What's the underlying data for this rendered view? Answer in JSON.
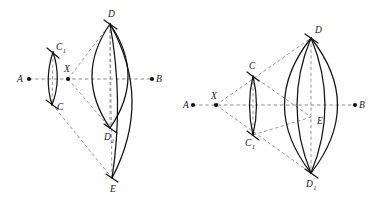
{
  "figure": {
    "background_color": "#ffffff",
    "stroke_color": "#141414",
    "dash_color": "#8a8a8a",
    "width": 370,
    "height": 202
  },
  "panels": [
    {
      "id": "left",
      "name": "left-construction",
      "axis": {
        "y": 79,
        "x_start": 29,
        "x_end": 152
      },
      "points": [
        {
          "key": "A",
          "label": "A",
          "sub": "",
          "x": 29,
          "y": 79,
          "label_x": 17,
          "label_y": 82,
          "dot": true
        },
        {
          "key": "X",
          "label": "X",
          "sub": "",
          "x": 68,
          "y": 79,
          "label_x": 64,
          "label_y": 72,
          "dot": true
        },
        {
          "key": "B",
          "label": "B",
          "sub": "",
          "x": 152,
          "y": 79,
          "label_x": 156,
          "label_y": 82,
          "dot": true
        },
        {
          "key": "C1",
          "label": "C",
          "sub": "1",
          "x": 53,
          "y": 53,
          "label_x": 56,
          "label_y": 50,
          "dot": false
        },
        {
          "key": "C",
          "label": "C",
          "sub": "",
          "x": 52,
          "y": 104,
          "label_x": 57,
          "label_y": 110,
          "dot": false
        },
        {
          "key": "D",
          "label": "D",
          "sub": "",
          "x": 110,
          "y": 24,
          "label_x": 108,
          "label_y": 17,
          "dot": false
        },
        {
          "key": "D1",
          "label": "D",
          "sub": "1",
          "x": 110,
          "y": 128,
          "label_x": 104,
          "label_y": 140,
          "dot": false
        },
        {
          "key": "E",
          "label": "E",
          "sub": "",
          "x": 112,
          "y": 178,
          "label_x": 110,
          "label_y": 192,
          "dot": false
        }
      ],
      "dashed_lines": [
        {
          "name": "axis-a-b",
          "from": "A",
          "to": "B"
        },
        {
          "name": "chord-d-d1",
          "from": "D",
          "to": "D1"
        },
        {
          "name": "chord-c1-c",
          "from": "C1",
          "to": "C"
        },
        {
          "name": "ray-x-d",
          "from": "X",
          "to": "D"
        },
        {
          "name": "ray-x-d1",
          "from": "X",
          "to": "D1"
        },
        {
          "name": "ray-c-e",
          "from": "C",
          "to": "E"
        },
        {
          "name": "ray-d-e",
          "from": "D",
          "to": "E"
        }
      ],
      "arcs": [
        {
          "name": "small-lens-left",
          "d": "M 53 52 Q 44 79 52 105"
        },
        {
          "name": "small-lens-right",
          "d": "M 53 52 Q 62 79 52 105"
        },
        {
          "name": "big-lens-left",
          "d": "M 110 24 Q 74 76 110 128"
        },
        {
          "name": "big-lens-right",
          "d": "M 110 24 Q 146 76 110 128"
        },
        {
          "name": "long-arc-inner",
          "d": "M 110 24 Q 124 101 112 178"
        },
        {
          "name": "long-arc-outer",
          "d": "M 110 24 Q 153 100 112 178"
        }
      ],
      "ticks": [
        {
          "name": "tick-c1",
          "x1": 47,
          "y1": 48,
          "x2": 59,
          "y2": 58
        },
        {
          "name": "tick-c",
          "x1": 46,
          "y1": 100,
          "x2": 58,
          "y2": 109
        },
        {
          "name": "tick-d",
          "x1": 104,
          "y1": 20,
          "x2": 117,
          "y2": 29
        },
        {
          "name": "tick-d1",
          "x1": 104,
          "y1": 124,
          "x2": 117,
          "y2": 133
        },
        {
          "name": "tick-e",
          "x1": 106,
          "y1": 174,
          "x2": 118,
          "y2": 182
        }
      ]
    },
    {
      "id": "right",
      "name": "right-construction",
      "axis": {
        "y": 105,
        "x_start": 193,
        "x_end": 355
      },
      "points": [
        {
          "key": "A",
          "label": "A",
          "sub": "",
          "x": 193,
          "y": 105,
          "label_x": 183,
          "label_y": 108,
          "dot": true
        },
        {
          "key": "X",
          "label": "X",
          "sub": "",
          "x": 216,
          "y": 105,
          "label_x": 211,
          "label_y": 99,
          "dot": true
        },
        {
          "key": "B",
          "label": "B",
          "sub": "",
          "x": 355,
          "y": 105,
          "label_x": 359,
          "label_y": 108,
          "dot": true
        },
        {
          "key": "C",
          "label": "C",
          "sub": "",
          "x": 253,
          "y": 76,
          "label_x": 249,
          "label_y": 69,
          "dot": false
        },
        {
          "key": "C1",
          "label": "C",
          "sub": "1",
          "x": 253,
          "y": 135,
          "label_x": 245,
          "label_y": 146,
          "dot": false
        },
        {
          "key": "D",
          "label": "D",
          "sub": "",
          "x": 311,
          "y": 38,
          "label_x": 315,
          "label_y": 33,
          "dot": false
        },
        {
          "key": "E",
          "label": "E",
          "sub": "",
          "x": 311,
          "y": 117,
          "label_x": 317,
          "label_y": 124,
          "dot": false
        },
        {
          "key": "D1",
          "label": "D",
          "sub": "1",
          "x": 311,
          "y": 173,
          "label_x": 306,
          "label_y": 187,
          "dot": false
        }
      ],
      "dashed_lines": [
        {
          "name": "axis-a-b",
          "from": "A",
          "to": "B"
        },
        {
          "name": "chord-c-c1",
          "from": "C",
          "to": "C1"
        },
        {
          "name": "chord-d-d1",
          "from": "D",
          "to": "D1"
        },
        {
          "name": "ray-x-c-d",
          "from": "X",
          "to": "D"
        },
        {
          "name": "ray-x-c1-d1",
          "from": "X",
          "to": "D1"
        },
        {
          "name": "ray-c-e",
          "from": "C",
          "to": "E"
        },
        {
          "name": "ray-c1-e",
          "from": "C1",
          "to": "E"
        }
      ],
      "arcs": [
        {
          "name": "small-lens-left",
          "d": "M 253 76 Q 246 105 253 135"
        },
        {
          "name": "small-lens-right",
          "d": "M 253 76 Q 260 105 253 135"
        },
        {
          "name": "big-lens-left",
          "d": "M 311 38 Q 258 105 311 173"
        },
        {
          "name": "big-lens-right",
          "d": "M 311 38 Q 364 105 311 173"
        },
        {
          "name": "inner-arc-left",
          "d": "M 311 38 Q 283 105 311 173"
        },
        {
          "name": "inner-arc-right",
          "d": "M 311 38 Q 339 105 311 173"
        }
      ],
      "ticks": [
        {
          "name": "tick-c",
          "x1": 247,
          "y1": 72,
          "x2": 259,
          "y2": 81
        },
        {
          "name": "tick-c1",
          "x1": 247,
          "y1": 131,
          "x2": 259,
          "y2": 140
        },
        {
          "name": "tick-d",
          "x1": 305,
          "y1": 34,
          "x2": 318,
          "y2": 43
        },
        {
          "name": "tick-d1",
          "x1": 305,
          "y1": 169,
          "x2": 318,
          "y2": 178
        }
      ]
    }
  ]
}
